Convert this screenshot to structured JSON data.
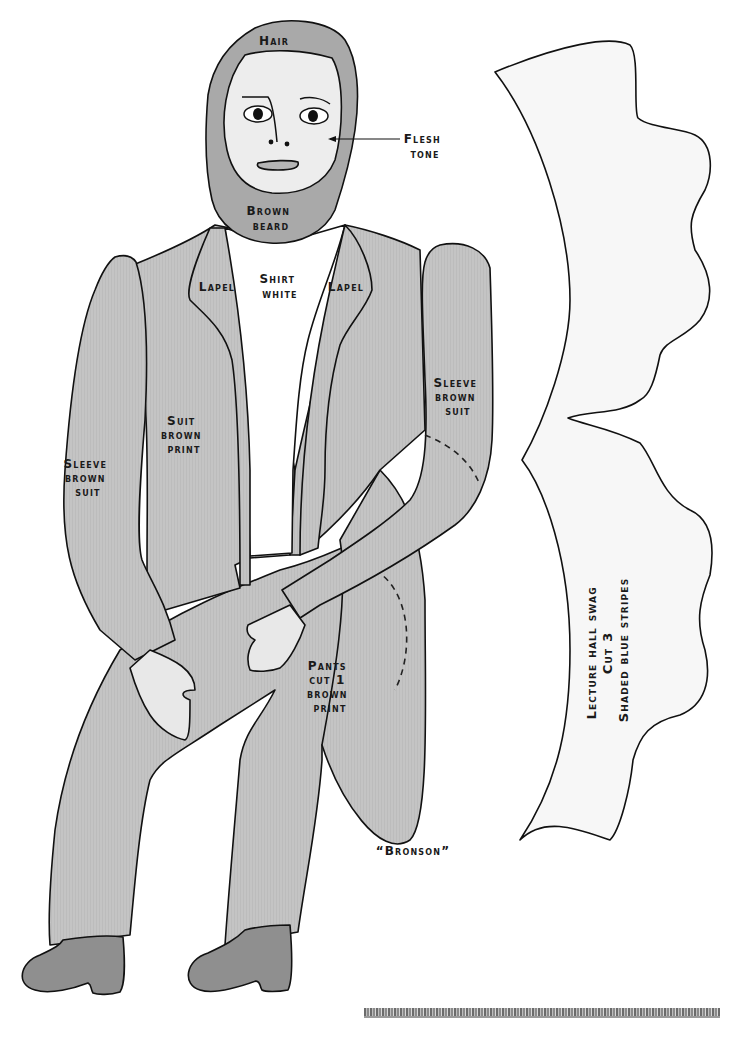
{
  "pattern": {
    "caption": "“Bronson”",
    "colors": {
      "hair_beard": "#a9a9a9",
      "face": "#ededed",
      "suit": "#c4c4c4",
      "shirt": "#ffffff",
      "hands": "#e8e8e8",
      "shoes": "#8f8f8f",
      "swag": "#f7f7f7",
      "outline": "#111111"
    },
    "labels": {
      "hair": "Hair",
      "flesh_1": "Flesh",
      "flesh_2": "tone",
      "beard_1": "Brown",
      "beard_2": "beard",
      "lapel_left": "Lapel",
      "lapel_right": "Lapel",
      "shirt_1": "Shirt",
      "shirt_2": "white",
      "suit_1": "Suit",
      "suit_2": "brown",
      "suit_3": "print",
      "sleeve_left_1": "Sleeve",
      "sleeve_left_2": "brown",
      "sleeve_left_3": "suit",
      "sleeve_right_1": "Sleeve",
      "sleeve_right_2": "brown",
      "sleeve_right_3": "suit",
      "pants_1": "Pants",
      "pants_2": "cut 1",
      "pants_3": "brown",
      "pants_4": "print"
    },
    "swag": {
      "line_1": "Lecture hall swag",
      "line_2": "Cut 3",
      "line_3": "Shaded blue stripes"
    }
  }
}
